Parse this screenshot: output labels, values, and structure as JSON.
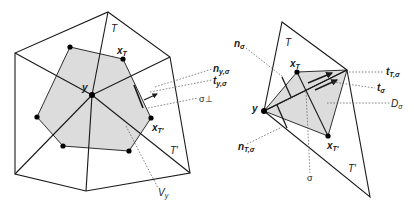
{
  "left_figure": {
    "labels": {
      "T": "T",
      "T_prime": "T′",
      "x_T": "x",
      "x_T_sub": "T",
      "x_Tp": "x",
      "x_Tp_sub": "T′",
      "y": "y",
      "n": "n",
      "n_sub": "y,σ",
      "t": "t",
      "t_sub": "y,σ",
      "sigma_perp": "σ⊥",
      "V": "V",
      "V_sub": "y"
    }
  },
  "right_figure": {
    "labels": {
      "T": "T",
      "T_prime": "T′",
      "x_T": "x",
      "x_T_sub": "T",
      "x_Tp": "x",
      "x_Tp_sub": "T′",
      "y": "y",
      "n_sigma": "n",
      "n_sigma_sub": "σ",
      "n_T": "n",
      "n_T_sub": "T,σ",
      "t_T": "t",
      "t_T_sub": "T,σ",
      "t_sigma": "t",
      "t_sigma_sub": "σ",
      "D": "D",
      "D_sub": "σ",
      "sigma": "σ"
    }
  },
  "colors": {
    "cell_fill": "#dcdcdc",
    "line": "#1a1a1a",
    "leader": "#555555"
  }
}
